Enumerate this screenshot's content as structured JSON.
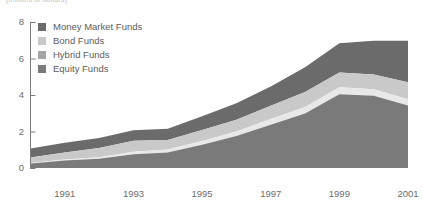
{
  "supertitle": "(trillions of dollars)",
  "legend": {
    "position": "top-left-inside",
    "items": [
      {
        "label": "Money Market Funds",
        "color": "#6b6b6b",
        "key": "money_market"
      },
      {
        "label": "Bond Funds",
        "color": "#c9c9c9",
        "key": "bond"
      },
      {
        "label": "Hybrid Funds",
        "color": "#a6a6a6",
        "key": "hybrid"
      },
      {
        "label": "Equity Funds",
        "color": "#7a7a7a",
        "key": "equity"
      }
    ]
  },
  "axes": {
    "y": {
      "label": "",
      "ticks": [
        "0",
        "2",
        "4",
        "6",
        "8"
      ],
      "min": 0,
      "max": 8,
      "step": 2
    },
    "x": {
      "label": "",
      "ticks": [
        "1991",
        "1993",
        "1995",
        "1997",
        "1999",
        "2001"
      ],
      "min": 1990,
      "max": 2001
    }
  },
  "chart_data": {
    "type": "area",
    "stacked": true,
    "title": "",
    "subtitle": "(trillions of dollars)",
    "xlabel": "",
    "ylabel": "",
    "ylim": [
      0,
      8
    ],
    "xlim": [
      1990,
      2001
    ],
    "grid": false,
    "legend_position": "upper left",
    "x": [
      1990,
      1991,
      1992,
      1993,
      1994,
      1995,
      1996,
      1997,
      1998,
      1999,
      2000,
      2001
    ],
    "tick_labels": [
      "1991",
      "1993",
      "1995",
      "1997",
      "1999",
      "2001"
    ],
    "series": [
      {
        "name": "Equity Funds",
        "color": "#7a7a7a",
        "order": 1,
        "values": [
          0.24,
          0.41,
          0.51,
          0.75,
          0.85,
          1.27,
          1.75,
          2.37,
          2.98,
          4.04,
          3.96,
          3.42
        ]
      },
      {
        "name": "Hybrid Funds",
        "color": "#e8e8e8",
        "order": 2,
        "values": [
          0.04,
          0.05,
          0.08,
          0.14,
          0.16,
          0.21,
          0.25,
          0.32,
          0.36,
          0.38,
          0.35,
          0.35
        ]
      },
      {
        "name": "Bond Funds",
        "color": "#c9c9c9",
        "order": 3,
        "values": [
          0.29,
          0.39,
          0.5,
          0.61,
          0.53,
          0.6,
          0.65,
          0.72,
          0.83,
          0.81,
          0.81,
          0.93
        ]
      },
      {
        "name": "Money Market Funds",
        "color": "#6b6b6b",
        "order": 4,
        "values": [
          0.5,
          0.54,
          0.55,
          0.57,
          0.61,
          0.75,
          0.9,
          1.06,
          1.35,
          1.61,
          1.85,
          2.27
        ]
      }
    ],
    "totals": [
      1.07,
      1.39,
      1.64,
      2.07,
      2.15,
      2.83,
      3.55,
      4.47,
      5.52,
      6.84,
      6.97,
      6.97
    ]
  },
  "colors": {
    "axis": "#7d7d7d",
    "text": "#6d6d6d",
    "money_market": "#6b6b6b",
    "bond": "#c9c9c9",
    "hybrid": "#e8e8e8",
    "equity": "#7a7a7a",
    "background": "#ffffff"
  }
}
